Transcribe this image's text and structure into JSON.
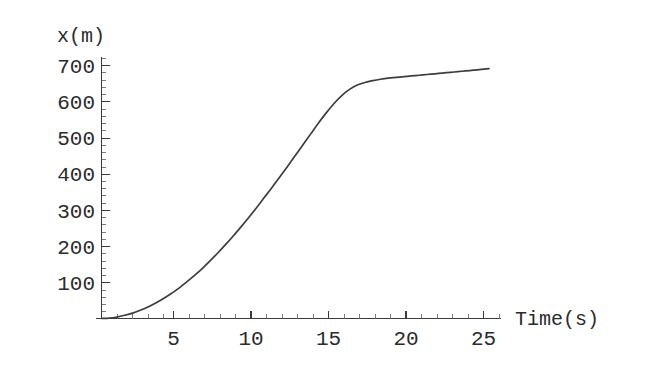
{
  "chart_data": {
    "type": "line",
    "title": "",
    "xlabel": "Time(s)",
    "ylabel": "x(m)",
    "xlim": [
      0,
      26.5
    ],
    "ylim": [
      0,
      740
    ],
    "xticks": [
      5,
      10,
      15,
      20,
      25
    ],
    "xtick_labels": [
      "5",
      "10",
      "15",
      "20",
      "25"
    ],
    "yticks": [
      100,
      200,
      300,
      400,
      500,
      600,
      700
    ],
    "ytick_labels": [
      "100",
      "200",
      "300",
      "400",
      "500",
      "600",
      "700"
    ],
    "x_minor_step": 1,
    "y_minor_step": 20,
    "grid": false,
    "legend": null,
    "series": [
      {
        "name": "position",
        "color": "#3d3d3d",
        "x": [
          0,
          0.5,
          1,
          1.5,
          2,
          2.5,
          3,
          3.5,
          4,
          4.5,
          5,
          5.5,
          6,
          6.5,
          7,
          7.5,
          8,
          8.5,
          9,
          9.5,
          10,
          10.5,
          11,
          11.5,
          12,
          12.5,
          13,
          13.5,
          14,
          14.5,
          15,
          15.5,
          16,
          16.5,
          17,
          17.5,
          18,
          18.5,
          19,
          19.5,
          20,
          20.5,
          21,
          21.5,
          22,
          22.5,
          23,
          23.5,
          24,
          24.5,
          25
        ],
        "y": [
          0,
          1,
          4,
          9,
          15,
          23,
          32,
          43,
          55,
          69,
          84,
          101,
          119,
          138,
          159,
          181,
          204,
          228,
          253,
          279,
          306,
          334,
          362,
          391,
          420,
          450,
          480,
          510,
          540,
          568,
          594,
          616,
          633,
          645,
          652,
          657,
          661,
          664,
          666,
          668,
          670,
          672,
          674,
          676,
          678,
          680,
          682,
          684,
          686,
          688,
          690
        ]
      }
    ],
    "annotations": []
  },
  "axes": {
    "x_axis_label": "Time(s)",
    "y_axis_label": "x(m)"
  }
}
